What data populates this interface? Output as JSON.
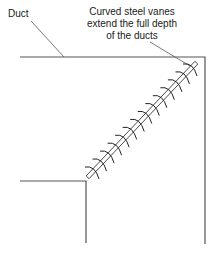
{
  "diagram": {
    "type": "duct elbow with turning vanes",
    "labels": {
      "duct": "Duct",
      "vanes_line1": "Curved steel vanes",
      "vanes_line2": "extend the full depth",
      "vanes_line3": "of the ducts"
    },
    "colors": {
      "line": "#555555",
      "text": "#1a1a1a",
      "background": "#ffffff"
    },
    "vane_count": 14
  }
}
